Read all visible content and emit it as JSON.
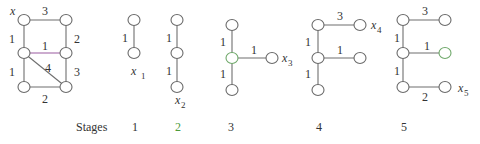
{
  "figure": {
    "colors": {
      "edge": "#6f6f6f",
      "highlight_edge": "#9a5aa0",
      "highlight_node": "#6fa86a",
      "stage_highlight": "#4d9a3c"
    },
    "graph": {
      "start_label": "x",
      "edges": [
        {
          "from": "TL",
          "to": "TR",
          "weight": "3"
        },
        {
          "from": "TL",
          "to": "ML",
          "weight": "1"
        },
        {
          "from": "TR",
          "to": "MR",
          "weight": "2"
        },
        {
          "from": "ML",
          "to": "MR",
          "weight": "1",
          "highlight": true
        },
        {
          "from": "ML",
          "to": "BR",
          "weight": "4"
        },
        {
          "from": "ML",
          "to": "BL",
          "weight": "1"
        },
        {
          "from": "MR",
          "to": "BR",
          "weight": "3"
        },
        {
          "from": "BL",
          "to": "BR",
          "weight": "2"
        }
      ]
    },
    "stage1": {
      "edge_weights": [
        "1"
      ],
      "new_vertex": "x",
      "new_vertex_sub": "1"
    },
    "stage2": {
      "edge_weights": [
        "1",
        "1"
      ],
      "new_vertex": "x",
      "new_vertex_sub": "2"
    },
    "stage3": {
      "edge_weights": [
        "1",
        "1",
        "1"
      ],
      "new_vertex": "x",
      "new_vertex_sub": "3"
    },
    "stage4": {
      "edge_weights": [
        "3",
        "1",
        "1",
        "1"
      ],
      "new_vertex": "x",
      "new_vertex_sub": "4"
    },
    "stage5": {
      "edge_weights": [
        "3",
        "1",
        "1",
        "1",
        "2"
      ],
      "new_vertex": "x",
      "new_vertex_sub": "5"
    },
    "stages_row": {
      "label": "Stages",
      "numbers": [
        "1",
        "2",
        "3",
        "4",
        "5"
      ],
      "highlighted_index": 1
    }
  }
}
